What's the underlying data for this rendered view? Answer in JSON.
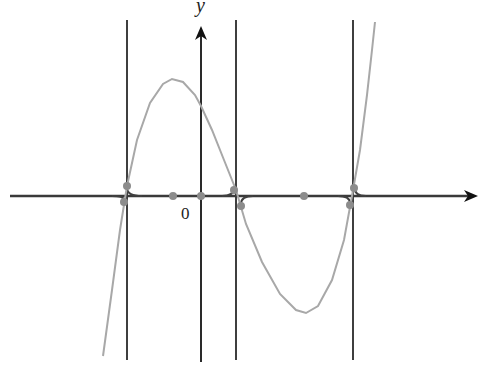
{
  "diagram": {
    "type": "function-graph",
    "axes": {
      "x_axis": {
        "y_px": 196,
        "x_start": 10,
        "x_end": 478,
        "arrow": "right",
        "color": "#3a3a3a"
      },
      "y_axis": {
        "x_px": 201,
        "y_start": 362,
        "y_end": 26,
        "arrow": "up",
        "color": "#2a2a2a"
      },
      "y_label": "y",
      "origin_label": "0"
    },
    "vertical_lines": [
      {
        "x_px": 127,
        "y_top": 20,
        "y_bottom": 360
      },
      {
        "x_px": 236,
        "y_top": 20,
        "y_bottom": 360
      },
      {
        "x_px": 353,
        "y_top": 20,
        "y_bottom": 360
      }
    ],
    "curve": {
      "color": "#a8a8a8",
      "points": [
        [
          103,
          356
        ],
        [
          112,
          290
        ],
        [
          120,
          230
        ],
        [
          127,
          186
        ],
        [
          137,
          140
        ],
        [
          150,
          103
        ],
        [
          163,
          84
        ],
        [
          172,
          79
        ],
        [
          183,
          82
        ],
        [
          195,
          95
        ],
        [
          201,
          106
        ],
        [
          212,
          130
        ],
        [
          224,
          160
        ],
        [
          236,
          190
        ],
        [
          246,
          224
        ],
        [
          262,
          262
        ],
        [
          280,
          294
        ],
        [
          296,
          310
        ],
        [
          306,
          313
        ],
        [
          318,
          306
        ],
        [
          332,
          280
        ],
        [
          344,
          240
        ],
        [
          352,
          196
        ],
        [
          360,
          150
        ],
        [
          367,
          95
        ],
        [
          372,
          50
        ],
        [
          375,
          22
        ]
      ]
    },
    "axis_dots": [
      {
        "x_px": 173,
        "y_px": 196
      },
      {
        "x_px": 201,
        "y_px": 196
      },
      {
        "x_px": 304,
        "y_px": 196
      }
    ],
    "crossing_dots": [
      {
        "x_px": 127,
        "y_px": 186
      },
      {
        "x_px": 124,
        "y_px": 202
      },
      {
        "x_px": 234,
        "y_px": 190
      },
      {
        "x_px": 241,
        "y_px": 206
      },
      {
        "x_px": 354,
        "y_px": 188
      },
      {
        "x_px": 350,
        "y_px": 205
      }
    ],
    "corner_arcs": [
      {
        "from": [
          127,
          188
        ],
        "to": [
          142,
          196
        ]
      },
      {
        "from": [
          124,
          200
        ],
        "to": [
          112,
          196
        ]
      },
      {
        "from": [
          234,
          188
        ],
        "to": [
          222,
          196
        ]
      },
      {
        "from": [
          241,
          204
        ],
        "to": [
          253,
          196
        ]
      },
      {
        "from": [
          354,
          186
        ],
        "to": [
          366,
          196
        ]
      },
      {
        "from": [
          350,
          203
        ],
        "to": [
          338,
          196
        ]
      }
    ],
    "colors": {
      "line": "#3f3f3f",
      "curve": "#a8a8a8",
      "dot": "#8c8c8c",
      "axis_arrow": "#111111"
    }
  }
}
